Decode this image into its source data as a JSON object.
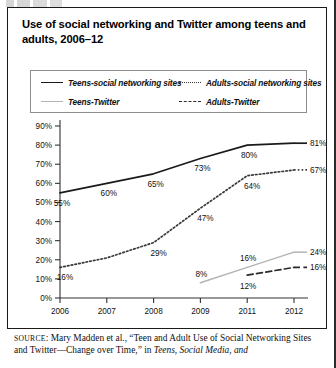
{
  "figure": {
    "title": "Use of social networking and Twitter among teens and adults, 2006–12"
  },
  "source": {
    "keyword": "SOURCE",
    "text_before_italic": ": Mary Madden et al., “Teen and Adult Use of Social Networking Sites and Twitter—Change over Time,” in ",
    "italic_tail": "Teens, Social Media, and"
  },
  "legend": {
    "items": [
      {
        "label": "Teens-social networking sites",
        "style": "solid",
        "color": "#1a1a1a"
      },
      {
        "label": "Adults-social networking sites",
        "style": "dotted",
        "color": "#3a3a3a"
      },
      {
        "label": "Teens-Twitter",
        "style": "gray-solid",
        "color": "#b4b4b4"
      },
      {
        "label": "Adults-Twitter",
        "style": "dashed",
        "color": "#2a2a2a"
      }
    ]
  },
  "chart_data": {
    "type": "line",
    "title": "Use of social networking and Twitter among teens and adults, 2006–12",
    "xlabel": "",
    "ylabel": "",
    "x": [
      "2006",
      "2007",
      "2008",
      "2009",
      "2011",
      "2012"
    ],
    "categories": [
      "2006",
      "2007",
      "2008",
      "2009",
      "2011",
      "2012"
    ],
    "ylim": [
      0,
      90
    ],
    "yticks": [
      "0%",
      "10%",
      "20%",
      "30%",
      "40%",
      "50%",
      "60%",
      "70%",
      "80%",
      "90%"
    ],
    "ytick_values": [
      0,
      10,
      20,
      30,
      40,
      50,
      60,
      70,
      80,
      90
    ],
    "grid": false,
    "legend_position": "top",
    "series": [
      {
        "name": "Teens-social networking sites",
        "style": "solid",
        "color": "#1a1a1a",
        "values": [
          55,
          60,
          65,
          73,
          80,
          81
        ],
        "labels": [
          "55%",
          "60%",
          "65%",
          "73%",
          "80%",
          "81%"
        ]
      },
      {
        "name": "Adults-social networking sites",
        "style": "dotted",
        "color": "#3a3a3a",
        "values": [
          16,
          21,
          29,
          47,
          64,
          67
        ],
        "labels": [
          "16%",
          "",
          "29%",
          "47%",
          "64%",
          "67%"
        ]
      },
      {
        "name": "Teens-Twitter",
        "style": "gray-solid",
        "color": "#b4b4b4",
        "values": [
          null,
          null,
          null,
          8,
          16,
          24
        ],
        "labels": [
          "",
          "",
          "",
          "8%",
          "16%",
          "24%"
        ]
      },
      {
        "name": "Adults-Twitter",
        "style": "dashed",
        "color": "#2a2a2a",
        "values": [
          null,
          null,
          null,
          null,
          12,
          16
        ],
        "labels": [
          "",
          "",
          "",
          "",
          "12%",
          "16%"
        ]
      }
    ]
  }
}
